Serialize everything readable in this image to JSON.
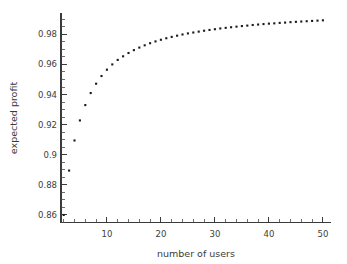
{
  "chart_data": {
    "type": "scatter",
    "title": "",
    "xlabel": "number of users",
    "ylabel": "expected profit",
    "xlim": [
      1.5,
      51.5
    ],
    "ylim": [
      0.855,
      0.9945
    ],
    "grid": false,
    "legend": "none",
    "marker": "square-dot",
    "marker_color": "#1a1a1a",
    "x_ticks_major": [
      10,
      20,
      30,
      40,
      50
    ],
    "x_ticks_major_labels": [
      "10",
      "20",
      "30",
      "40",
      "50"
    ],
    "x_tick_minor_step": 2,
    "y_ticks_major": [
      0.86,
      0.88,
      0.9,
      0.92,
      0.94,
      0.96,
      0.98
    ],
    "y_ticks_major_labels": [
      "0.86",
      "0.88",
      "0.9",
      "0.92",
      "0.94",
      "0.96",
      "0.98"
    ],
    "y_tick_minor_step": 0.005,
    "series": [
      {
        "name": "expected profit",
        "x": [
          2,
          3,
          4,
          5,
          6,
          7,
          8,
          9,
          10,
          11,
          12,
          13,
          14,
          15,
          16,
          17,
          18,
          19,
          20,
          21,
          22,
          23,
          24,
          25,
          26,
          27,
          28,
          29,
          30,
          31,
          32,
          33,
          34,
          35,
          36,
          37,
          38,
          39,
          40,
          41,
          42,
          43,
          44,
          45,
          46,
          47,
          48,
          49,
          50
        ],
        "values": [
          0.86,
          0.8895,
          0.9095,
          0.9228,
          0.933,
          0.941,
          0.9472,
          0.9523,
          0.9565,
          0.96,
          0.963,
          0.9654,
          0.9676,
          0.9695,
          0.9712,
          0.9727,
          0.9741,
          0.9753,
          0.9764,
          0.9774,
          0.9783,
          0.9791,
          0.9799,
          0.9806,
          0.9812,
          0.9818,
          0.9824,
          0.9829,
          0.9834,
          0.9839,
          0.9843,
          0.9847,
          0.9851,
          0.9855,
          0.9858,
          0.9862,
          0.9865,
          0.9868,
          0.9871,
          0.9873,
          0.9876,
          0.9878,
          0.9881,
          0.9883,
          0.9885,
          0.9887,
          0.9889,
          0.9891,
          0.9893
        ]
      }
    ]
  },
  "figure": {
    "background_color": "#ffffff",
    "axis_color": "#3a3a3a",
    "text_color": "#3d3d3d"
  }
}
